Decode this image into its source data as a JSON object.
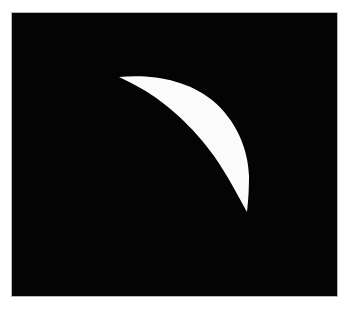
{
  "page": {
    "background_color": "#ffffff",
    "width": 350,
    "height": 311
  },
  "image": {
    "name": "binary-crescent-image",
    "alt_text": "White crescent on black background",
    "background_color": "#040404",
    "frame": {
      "x": 12,
      "y": 13,
      "width": 325,
      "height": 283
    },
    "border_color": "#b9b9b9"
  },
  "shape": {
    "name": "crescent",
    "fill_color": "#fbfbfb",
    "description": "Sickle / crescent shape with sharp tips at upper-left and bottom",
    "tip_upper_left": {
      "x": 119,
      "y": 77
    },
    "tip_bottom": {
      "x": 247,
      "y": 212
    },
    "max_extent_right": {
      "x": 249,
      "y": 176
    },
    "outer_edge_path": "M119,77 C150,74 186,79 212,100 C236,120 248,148 249,176 C249,192 248,203 247,212",
    "inner_edge_path": "M247,212 C238,196 228,176 214,156 C194,128 165,100 133,84 C128,81 123,79 119,77"
  }
}
